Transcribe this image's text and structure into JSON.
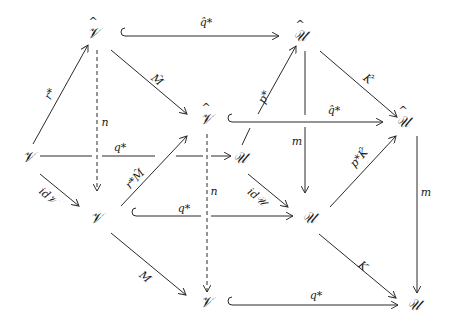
{
  "diagram": {
    "type": "commutative-diagram",
    "stroke_color": "#2a2a2a",
    "nodes": {
      "vhat_top": {
        "label": "𝒱",
        "hat": true
      },
      "uhat_top": {
        "label": "𝒰",
        "hat": true
      },
      "vhat_mid": {
        "label": "𝒱",
        "hat": true
      },
      "uhat_right": {
        "label": "𝒰",
        "hat": true
      },
      "v_left": {
        "label": "𝒱"
      },
      "u_mid": {
        "label": "𝒰"
      },
      "v_lower": {
        "label": "𝒱"
      },
      "u_lower": {
        "label": "𝒰"
      },
      "v_bottom": {
        "label": "𝒱"
      },
      "u_bottom": {
        "label": "𝒰"
      }
    },
    "edges": {
      "vhat_top_to_uhat_top": "q̂*",
      "vhat_top_to_vhat_mid": "M̂",
      "uhat_top_to_uhat_right": "K̂",
      "vhat_mid_to_uhat_right": "q̂*",
      "v_left_to_vhat_top": "r*",
      "v_left_to_u_mid": "q*",
      "u_mid_to_uhat_top": "p*",
      "vhat_top_to_v_lower": "n",
      "uhat_top_to_u_lower": "m",
      "v_left_to_v_lower": "id𝒱",
      "v_lower_to_vhat_mid": "r*M̂",
      "vhat_mid_to_v_bottom": "n",
      "u_mid_to_u_lower": "id𝒰",
      "u_lower_to_uhat_right": "p*K̂",
      "v_lower_to_u_lower": "q*",
      "uhat_right_to_u_bottom": "m",
      "v_lower_to_v_bottom": "M",
      "u_lower_to_u_bottom": "K",
      "v_bottom_to_u_bottom": "q*"
    }
  }
}
